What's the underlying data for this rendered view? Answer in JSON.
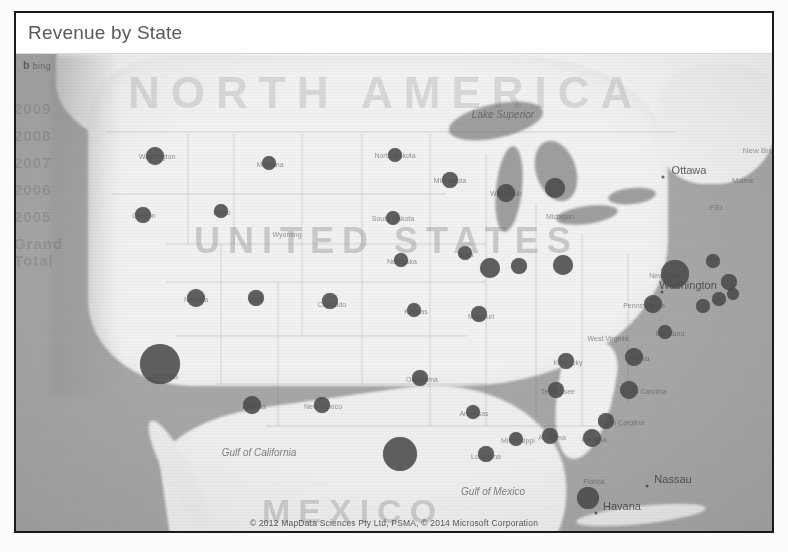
{
  "visual": {
    "title": "Revenue by State",
    "type": "bubble-map",
    "basemap_provider": "bing",
    "bing_logo_text": "bing",
    "attribution": "© 2012 MapData Sciences Pty Ltd, PSMA, © 2014 Microsoft Corporation",
    "bubble_color": "#4b4b4b",
    "land_color": "#f0f0ef",
    "water_color": "#a6a6a6",
    "title_color": "#595959"
  },
  "ghost_text": [
    "2009",
    "2008",
    "2007",
    "2006",
    "2005",
    "Grand Total"
  ],
  "watermarks": [
    {
      "id": "north-america",
      "text": "NORTH AMERICA"
    },
    {
      "id": "united-states",
      "text": "UNITED STATES"
    },
    {
      "id": "mexico",
      "text": "MEXICO"
    }
  ],
  "water_labels": [
    {
      "name": "Lake Superior",
      "text": "Lake Superior",
      "x": 487,
      "y": 60
    },
    {
      "name": "Gulf of Mexico",
      "text": "Gulf of Mexico",
      "x": 477,
      "y": 437
    },
    {
      "name": "Gulf of California",
      "text": "Gulf of California",
      "x": 243,
      "y": 398
    }
  ],
  "city_labels": [
    {
      "name": "Ottawa",
      "text": "Ottawa",
      "x": 673,
      "y": 116
    },
    {
      "name": "Washington",
      "text": "Washington",
      "x": 672,
      "y": 231
    },
    {
      "name": "Havana",
      "text": "Havana",
      "x": 606,
      "y": 452
    },
    {
      "name": "Nassau",
      "text": "Nassau",
      "x": 657,
      "y": 425
    }
  ],
  "region_labels": [
    {
      "text": "New Brunswick",
      "x": 754,
      "y": 96
    },
    {
      "text": "Maine",
      "x": 727,
      "y": 126
    },
    {
      "text": "PEI",
      "x": 700,
      "y": 153
    }
  ],
  "chart_data": {
    "type": "bubble-map",
    "title": "Revenue by State",
    "measure": "Revenue",
    "location_field": "State",
    "size_encoding": "bubble area proportional to revenue",
    "legend": "none",
    "grid": false,
    "states": [
      {
        "state": "Washington",
        "label": "Washington",
        "x": 139,
        "y": 102,
        "radius": 9,
        "revenue": 42
      },
      {
        "state": "Oregon",
        "label": "Oregon",
        "x": 127,
        "y": 161,
        "radius": 8,
        "revenue": 33
      },
      {
        "state": "Idaho",
        "label": "Idaho",
        "x": 205,
        "y": 157,
        "radius": 7,
        "revenue": 25
      },
      {
        "state": "Montana",
        "label": "Montana",
        "x": 253,
        "y": 109,
        "radius": 7,
        "revenue": 24
      },
      {
        "state": "Wyoming",
        "label": "Wyoming",
        "x": 270,
        "y": 180,
        "radius": 0,
        "revenue": 0
      },
      {
        "state": "North Dakota",
        "label": "North Dakota",
        "x": 379,
        "y": 101,
        "radius": 7,
        "revenue": 23
      },
      {
        "state": "South Dakota",
        "label": "South Dakota",
        "x": 377,
        "y": 164,
        "radius": 7,
        "revenue": 22
      },
      {
        "state": "Minnesota",
        "label": "Minnesota",
        "x": 434,
        "y": 126,
        "radius": 8,
        "revenue": 34
      },
      {
        "state": "Wisconsin",
        "label": "Wisconsin",
        "x": 490,
        "y": 139,
        "radius": 9,
        "revenue": 41
      },
      {
        "state": "Michigan",
        "label": "Michigan",
        "x": 539,
        "y": 134,
        "radius": 10,
        "revenue": 52
      },
      {
        "state": "Nevada",
        "label": "Nevada",
        "x": 180,
        "y": 244,
        "radius": 9,
        "revenue": 40
      },
      {
        "state": "Utah",
        "label": "Utah",
        "x": 240,
        "y": 244,
        "radius": 8,
        "revenue": 31
      },
      {
        "state": "Colorado",
        "label": "Colorado",
        "x": 314,
        "y": 247,
        "radius": 8,
        "revenue": 32
      },
      {
        "state": "California",
        "label": "California",
        "x": 144,
        "y": 310,
        "radius": 20,
        "revenue": 205
      },
      {
        "state": "Arizona",
        "label": "Arizona",
        "x": 236,
        "y": 351,
        "radius": 9,
        "revenue": 44
      },
      {
        "state": "New Mexico",
        "label": "New Mexico",
        "x": 306,
        "y": 351,
        "radius": 8,
        "revenue": 30
      },
      {
        "state": "Nebraska",
        "label": "Nebraska",
        "x": 385,
        "y": 206,
        "radius": 7,
        "revenue": 20
      },
      {
        "state": "Iowa",
        "label": "Iowa",
        "x": 449,
        "y": 199,
        "radius": 7,
        "revenue": 26
      },
      {
        "state": "Illinois",
        "label": "Illinois",
        "x": 474,
        "y": 214,
        "radius": 10,
        "revenue": 55
      },
      {
        "state": "Indiana",
        "label": "Indiana",
        "x": 503,
        "y": 212,
        "radius": 8,
        "revenue": 36
      },
      {
        "state": "Ohio",
        "label": "Ohio",
        "x": 547,
        "y": 211,
        "radius": 10,
        "revenue": 54
      },
      {
        "state": "Kansas",
        "label": "Kansas",
        "x": 398,
        "y": 256,
        "radius": 7,
        "revenue": 21
      },
      {
        "state": "Missouri",
        "label": "Missouri",
        "x": 463,
        "y": 260,
        "radius": 8,
        "revenue": 35
      },
      {
        "state": "Oklahoma",
        "label": "Oklahoma",
        "x": 404,
        "y": 324,
        "radius": 8,
        "revenue": 29
      },
      {
        "state": "Arkansas",
        "label": "Arkansas",
        "x": 457,
        "y": 358,
        "radius": 7,
        "revenue": 22
      },
      {
        "state": "Texas",
        "label": "Texas",
        "x": 384,
        "y": 400,
        "radius": 17,
        "revenue": 160
      },
      {
        "state": "Louisiana",
        "label": "Louisiana",
        "x": 470,
        "y": 400,
        "radius": 8,
        "revenue": 34
      },
      {
        "state": "Mississippi",
        "label": "Mississippi",
        "x": 500,
        "y": 385,
        "radius": 7,
        "revenue": 19
      },
      {
        "state": "Alabama",
        "label": "Alabama",
        "x": 534,
        "y": 382,
        "radius": 8,
        "revenue": 28
      },
      {
        "state": "Georgia",
        "label": "Georgia",
        "x": 576,
        "y": 384,
        "radius": 9,
        "revenue": 38
      },
      {
        "state": "Florida",
        "label": "Florida",
        "x": 572,
        "y": 444,
        "radius": 11,
        "revenue": 66
      },
      {
        "state": "South Carolina",
        "label": "South Carolina",
        "x": 590,
        "y": 367,
        "radius": 8,
        "revenue": 27
      },
      {
        "state": "North Carolina",
        "label": "North Carolina",
        "x": 613,
        "y": 336,
        "radius": 9,
        "revenue": 45
      },
      {
        "state": "Tennessee",
        "label": "Tennessee",
        "x": 540,
        "y": 336,
        "radius": 8,
        "revenue": 31
      },
      {
        "state": "Kentucky",
        "label": "Kentucky",
        "x": 550,
        "y": 307,
        "radius": 8,
        "revenue": 33
      },
      {
        "state": "Virginia",
        "label": "Virginia",
        "x": 618,
        "y": 303,
        "radius": 9,
        "revenue": 43
      },
      {
        "state": "West Virginia",
        "label": "West Virginia",
        "x": 590,
        "y": 283,
        "radius": 0,
        "revenue": 0
      },
      {
        "state": "Maryland",
        "label": "Maryland",
        "x": 649,
        "y": 278,
        "radius": 7,
        "revenue": 24
      },
      {
        "state": "Pennsylvania",
        "label": "Pennsylvania",
        "x": 637,
        "y": 250,
        "radius": 9,
        "revenue": 40
      },
      {
        "state": "New Jersey",
        "label": "New Jersey",
        "x": 687,
        "y": 252,
        "radius": 7,
        "revenue": 23
      },
      {
        "state": "New York",
        "label": "New York",
        "x": 659,
        "y": 220,
        "radius": 14,
        "revenue": 105
      },
      {
        "state": "Connecticut",
        "label": "Connecticut",
        "x": 703,
        "y": 245,
        "radius": 7,
        "revenue": 20
      },
      {
        "state": "Rhode Island",
        "label": "Rhode Island",
        "x": 717,
        "y": 240,
        "radius": 6,
        "revenue": 15
      },
      {
        "state": "Massachusetts",
        "label": "Massachusetts",
        "x": 713,
        "y": 228,
        "radius": 8,
        "revenue": 30
      },
      {
        "state": "New Hampshire",
        "label": "New Hampshire",
        "x": 697,
        "y": 207,
        "radius": 7,
        "revenue": 21
      }
    ]
  },
  "state_labels": [
    {
      "text": "Washington",
      "x": 141,
      "y": 102
    },
    {
      "text": "Oregon",
      "x": 128,
      "y": 161
    },
    {
      "text": "Idaho",
      "x": 206,
      "y": 158
    },
    {
      "text": "Montana",
      "x": 254,
      "y": 110
    },
    {
      "text": "Wyoming",
      "x": 271,
      "y": 180
    },
    {
      "text": "North Dakota",
      "x": 379,
      "y": 101
    },
    {
      "text": "South Dakota",
      "x": 377,
      "y": 164
    },
    {
      "text": "Minnesota",
      "x": 434,
      "y": 126
    },
    {
      "text": "Wisconsin",
      "x": 490,
      "y": 139
    },
    {
      "text": "Michigan",
      "x": 544,
      "y": 162
    },
    {
      "text": "Nevada",
      "x": 180,
      "y": 245
    },
    {
      "text": "Utah",
      "x": 240,
      "y": 245
    },
    {
      "text": "Colorado",
      "x": 316,
      "y": 250
    },
    {
      "text": "California",
      "x": 147,
      "y": 322
    },
    {
      "text": "Arizona",
      "x": 238,
      "y": 352
    },
    {
      "text": "New Mexico",
      "x": 307,
      "y": 352
    },
    {
      "text": "Nebraska",
      "x": 386,
      "y": 207
    },
    {
      "text": "Iowa",
      "x": 450,
      "y": 200
    },
    {
      "text": "Missouri",
      "x": 465,
      "y": 262
    },
    {
      "text": "Kansas",
      "x": 400,
      "y": 257
    },
    {
      "text": "Oklahoma",
      "x": 406,
      "y": 325
    },
    {
      "text": "Arkansas",
      "x": 458,
      "y": 359
    },
    {
      "text": "Mississippi",
      "x": 502,
      "y": 386
    },
    {
      "text": "Alabama",
      "x": 536,
      "y": 383
    },
    {
      "text": "Georgia",
      "x": 578,
      "y": 385
    },
    {
      "text": "Florida",
      "x": 578,
      "y": 427
    },
    {
      "text": "Louisiana",
      "x": 470,
      "y": 402
    },
    {
      "text": "South Carolina",
      "x": 605,
      "y": 368
    },
    {
      "text": "North Carolina",
      "x": 628,
      "y": 337
    },
    {
      "text": "Tennessee",
      "x": 542,
      "y": 337
    },
    {
      "text": "Kentucky",
      "x": 552,
      "y": 308
    },
    {
      "text": "Virginia",
      "x": 622,
      "y": 304
    },
    {
      "text": "West Virginia",
      "x": 592,
      "y": 284
    },
    {
      "text": "Maryland",
      "x": 654,
      "y": 279
    },
    {
      "text": "Pennsylvania",
      "x": 628,
      "y": 251
    },
    {
      "text": "New York",
      "x": 648,
      "y": 221
    }
  ]
}
